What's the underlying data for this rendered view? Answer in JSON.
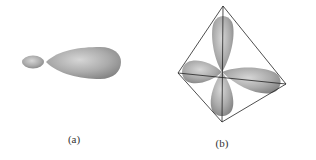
{
  "figure": {
    "panels": [
      {
        "id": "a",
        "label": "(a)",
        "description": "sp3 hybrid orbital: small lobe and large lobe along horizontal axis"
      },
      {
        "id": "b",
        "label": "(b)",
        "description": "four sp3 hybrid orbitals pointing to vertices of a tetrahedron"
      }
    ]
  },
  "colors": {
    "lobe_fill": "#a8a8a8",
    "lobe_highlight": "#d2d2d2",
    "lobe_shadow": "#8a8a8a",
    "edge": "#222222"
  }
}
